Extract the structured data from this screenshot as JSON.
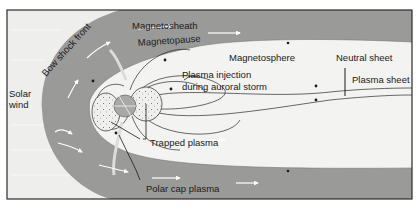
{
  "diagram": {
    "type": "magnetosphere-cross-section",
    "colors": {
      "background": "#eeeeec",
      "magnetosheath": "#9a9a98",
      "magnetosphere": "#f3f3f1",
      "frame": "#2a2a2a",
      "earth": "#a8a8a6",
      "lines": "#2a2a2a",
      "flow_arrows": "#ffffff"
    },
    "labels": {
      "solar_wind_1": "Solar",
      "solar_wind_2": "wind",
      "bow_shock": "Bow shock front",
      "magnetosheath": "Magnetosheath",
      "magnetopause": "Magnetopause",
      "magnetosphere": "Magnetosphere",
      "neutral_sheet": "Neutral sheet",
      "plasma_sheet": "Plasma sheet",
      "plasma_injection_1": "Plasma injection",
      "plasma_injection_2": "during auroral storm",
      "trapped_plasma": "Trapped plasma",
      "polar_cap_plasma": "Polar cap plasma"
    }
  }
}
